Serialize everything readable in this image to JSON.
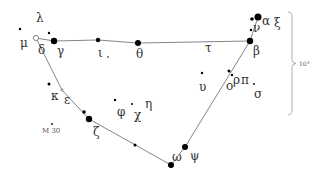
{
  "colors": {
    "star": "#000000",
    "line": "#777777",
    "label": "#333333",
    "background": "#ffffff"
  },
  "stars": [
    {
      "id": "alpha",
      "label": "α",
      "x": 258,
      "y": 17,
      "r": 3.5,
      "lx": 262,
      "ly": 25
    },
    {
      "id": "alpha2",
      "label": "",
      "x": 252,
      "y": 19,
      "r": 1.8,
      "lx": 0,
      "ly": 0
    },
    {
      "id": "nu",
      "label": "ν",
      "x": 251,
      "y": 30,
      "r": 1.2,
      "lx": 253,
      "ly": 32
    },
    {
      "id": "xi",
      "label": "ξ",
      "x": 0,
      "y": 0,
      "r": 0,
      "lx": 274,
      "ly": 27
    },
    {
      "id": "beta",
      "label": "β",
      "x": 250,
      "y": 41,
      "r": 3.2,
      "lx": 253,
      "ly": 55
    },
    {
      "id": "tau",
      "label": "τ",
      "x": 0,
      "y": 0,
      "r": 0,
      "lx": 205,
      "ly": 52
    },
    {
      "id": "rho",
      "label": "ρ",
      "x": 229,
      "y": 71,
      "r": 1.5,
      "lx": 233,
      "ly": 84
    },
    {
      "id": "omicron",
      "label": "ο",
      "x": 232,
      "y": 75,
      "r": 1.2,
      "lx": 226,
      "ly": 90
    },
    {
      "id": "pi",
      "label": "π",
      "x": 0,
      "y": 0,
      "r": 0,
      "lx": 241,
      "ly": 84
    },
    {
      "id": "pi_dot",
      "label": "",
      "x": 254,
      "y": 84,
      "r": 0.9,
      "lx": 0,
      "ly": 0
    },
    {
      "id": "sigma",
      "label": "σ",
      "x": 0,
      "y": 0,
      "r": 0,
      "lx": 254,
      "ly": 98
    },
    {
      "id": "upsilon",
      "label": "υ",
      "x": 202,
      "y": 73,
      "r": 1.2,
      "lx": 199,
      "ly": 91
    },
    {
      "id": "theta",
      "label": "θ",
      "x": 138,
      "y": 43,
      "r": 3,
      "lx": 136,
      "ly": 58
    },
    {
      "id": "iota",
      "label": "ι",
      "x": 98,
      "y": 40,
      "r": 2.2,
      "lx": 98,
      "ly": 57
    },
    {
      "id": "iota_d",
      "label": "",
      "x": 108,
      "y": 57,
      "r": 0.8,
      "lx": 0,
      "ly": 0
    },
    {
      "id": "gamma",
      "label": "γ",
      "x": 54,
      "y": 41,
      "r": 3.2,
      "lx": 57,
      "ly": 55
    },
    {
      "id": "delta",
      "label": "δ",
      "x": 36,
      "y": 38,
      "r": 2.6,
      "lx": 38,
      "ly": 54,
      "hollow": true
    },
    {
      "id": "mu",
      "label": "μ",
      "x": 20,
      "y": 29,
      "r": 1.2,
      "lx": 20,
      "ly": 47
    },
    {
      "id": "lambda",
      "label": "λ",
      "x": 49,
      "y": 33,
      "r": 1.2,
      "lx": 36,
      "ly": 22
    },
    {
      "id": "kappa",
      "label": "κ",
      "x": 49,
      "y": 84,
      "r": 1.5,
      "lx": 51,
      "ly": 100
    },
    {
      "id": "epsilon",
      "label": "ε",
      "x": 62,
      "y": 90,
      "r": 1,
      "lx": 64,
      "ly": 104,
      "hollow": true
    },
    {
      "id": "zeta1",
      "label": "",
      "x": 84,
      "y": 112,
      "r": 1.8,
      "lx": 0,
      "ly": 0
    },
    {
      "id": "zeta",
      "label": "ζ",
      "x": 89,
      "y": 119,
      "r": 3.2,
      "lx": 93,
      "ly": 136
    },
    {
      "id": "z2",
      "label": "",
      "x": 135,
      "y": 145,
      "r": 1.5,
      "lx": 0,
      "ly": 0
    },
    {
      "id": "omega",
      "label": "ω",
      "x": 0,
      "y": 0,
      "r": 0,
      "lx": 172,
      "ly": 161
    },
    {
      "id": "omega_s",
      "label": "",
      "x": 171,
      "y": 165,
      "r": 3,
      "lx": 0,
      "ly": 0
    },
    {
      "id": "psi",
      "label": "ψ",
      "x": 185,
      "y": 147,
      "r": 3,
      "lx": 190,
      "ly": 160
    },
    {
      "id": "phi",
      "label": "φ",
      "x": 115,
      "y": 100,
      "r": 1.2,
      "lx": 117,
      "ly": 116
    },
    {
      "id": "chi",
      "label": "χ",
      "x": 132,
      "y": 104,
      "r": 1,
      "lx": 134,
      "ly": 119
    },
    {
      "id": "eta",
      "label": "η",
      "x": 0,
      "y": 0,
      "r": 0,
      "lx": 145,
      "ly": 108
    },
    {
      "id": "m30",
      "label": "M 30",
      "x": 52,
      "y": 124,
      "r": 0.9,
      "lx": 42,
      "ly": 133
    }
  ],
  "lines": [
    [
      36,
      38,
      54,
      41
    ],
    [
      54,
      41,
      98,
      40
    ],
    [
      98,
      40,
      138,
      43
    ],
    [
      138,
      43,
      250,
      41
    ],
    [
      250,
      41,
      258,
      17
    ],
    [
      250,
      41,
      185,
      147
    ],
    [
      185,
      147,
      171,
      165
    ],
    [
      171,
      165,
      89,
      119
    ],
    [
      89,
      119,
      62,
      90
    ],
    [
      62,
      90,
      36,
      38
    ]
  ],
  "scale": {
    "label": "10°",
    "x": 292,
    "y1": 12,
    "y2": 115
  }
}
